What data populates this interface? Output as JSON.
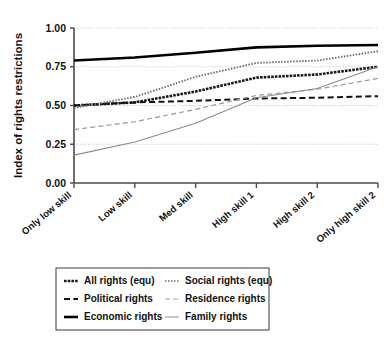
{
  "chart_data": {
    "type": "line",
    "title": "",
    "subtitle": "",
    "xlabel": "",
    "ylabel": "Index of rights restrictions",
    "categories": [
      "Only low skill",
      "Low skill",
      "Med skill",
      "High skill 1",
      "High skill 2",
      "Only high skill 2"
    ],
    "ylim": [
      0.0,
      1.0
    ],
    "yticks": [
      0.0,
      0.25,
      0.5,
      0.75,
      1.0
    ],
    "ytick_labels": [
      "0.00",
      "0.25",
      "0.50",
      "0.75",
      "1.00"
    ],
    "grid": true,
    "grid_axis": "y",
    "legend_position": "below",
    "legend_columns": 2,
    "series": [
      {
        "name": "All rights (equ)",
        "style": "dotted-thick",
        "color": "#1a1a1a",
        "values": [
          0.5,
          0.52,
          0.59,
          0.68,
          0.7,
          0.75
        ]
      },
      {
        "name": "Political rights",
        "style": "dashed",
        "color": "#111111",
        "values": [
          0.5,
          0.52,
          0.53,
          0.545,
          0.55,
          0.56
        ]
      },
      {
        "name": "Economic rights",
        "style": "solid-thick",
        "color": "#000000",
        "values": [
          0.79,
          0.81,
          0.84,
          0.875,
          0.885,
          0.89
        ]
      },
      {
        "name": "Social rights (equ)",
        "style": "dotted",
        "color": "#6e6e6e",
        "values": [
          0.485,
          0.555,
          0.685,
          0.775,
          0.79,
          0.85
        ]
      },
      {
        "name": "Residence rights",
        "style": "dashed-light",
        "color": "#999999",
        "values": [
          0.345,
          0.395,
          0.475,
          0.565,
          0.605,
          0.675
        ]
      },
      {
        "name": "Family rights",
        "style": "solid-thin",
        "color": "#8a8a8a",
        "values": [
          0.18,
          0.265,
          0.385,
          0.55,
          0.61,
          0.75
        ]
      }
    ]
  },
  "legend": {
    "entries": [
      {
        "label": "All rights (equ)",
        "style": "dotted-thick",
        "color": "#1a1a1a"
      },
      {
        "label": "Social rights (equ)",
        "style": "dotted",
        "color": "#8d8d8d"
      },
      {
        "label": "Political rights",
        "style": "dashed",
        "color": "#111111"
      },
      {
        "label": "Residence rights",
        "style": "dashed-light",
        "color": "#a5a5a5"
      },
      {
        "label": "Economic rights",
        "style": "solid-thick",
        "color": "#000000"
      },
      {
        "label": "Family rights",
        "style": "solid-thin",
        "color": "#9a9a9a"
      }
    ]
  },
  "colors": {
    "axis": "#4a4a4a",
    "grid": "#bdbdbd",
    "text": "#111111",
    "background": "#ffffff"
  }
}
